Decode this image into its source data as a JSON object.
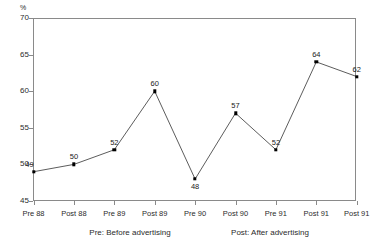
{
  "chart_data": {
    "type": "line",
    "title": "",
    "xlabel": "",
    "ylabel": "%",
    "ylim": [
      45,
      70
    ],
    "y_ticks": [
      45,
      50,
      55,
      60,
      65,
      70
    ],
    "grid": false,
    "legend": "none",
    "categories": [
      "Pre 88",
      "Post 88",
      "Pre 89",
      "Post 89",
      "Pre 90",
      "Post 90",
      "Pre 91",
      "Post 91",
      "Post 91"
    ],
    "values": [
      49,
      50,
      52,
      60,
      48,
      57,
      52,
      64,
      62
    ],
    "point_labels": [
      "49",
      "50",
      "52",
      "60",
      "48",
      "57",
      "52",
      "64",
      "62"
    ],
    "annotations": [
      "Pre: Before advertising",
      "Post: After advertising"
    ]
  },
  "axis": {
    "y_unit": "%"
  },
  "captions": {
    "pre": "Pre: Before advertising",
    "post": "Post: After advertising"
  },
  "colors": {
    "line": "#4a4a4a",
    "marker": "#000000",
    "axis": "#8a8a8a",
    "text": "#1a1a1a",
    "background": "#ffffff"
  }
}
